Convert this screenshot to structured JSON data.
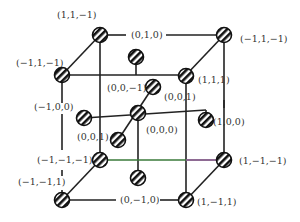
{
  "diagram": {
    "colors": {
      "line": "#222222",
      "accent_line": "#3a7a3a",
      "accent_line2": "#9a5aa0",
      "text": "#333333"
    },
    "nodes": [
      {
        "id": "n1",
        "x": 100,
        "y": 35,
        "label": "(1,1,−1)",
        "lx": 57,
        "ly": 18,
        "anchor": "start"
      },
      {
        "id": "n2",
        "x": 224,
        "y": 35,
        "label": "(−1,1,−1)",
        "lx": 240,
        "ly": 42,
        "anchor": "start"
      },
      {
        "id": "n3",
        "x": 62,
        "y": 75,
        "label": "(−1,1,−1)",
        "lx": 16,
        "ly": 66,
        "anchor": "start"
      },
      {
        "id": "n4",
        "x": 186,
        "y": 76,
        "label": "(1,1,1)",
        "lx": 198,
        "ly": 83,
        "anchor": "start"
      },
      {
        "id": "n5",
        "x": 136,
        "y": 57,
        "label": "",
        "lx": 0,
        "ly": 0,
        "anchor": "start"
      },
      {
        "id": "n6",
        "x": 153,
        "y": 87,
        "label": "(0,0,−1)",
        "lx": 107,
        "ly": 91,
        "anchor": "start"
      },
      {
        "id": "n7",
        "x": 138,
        "y": 113,
        "label": "(0,0,0)",
        "lx": 146,
        "ly": 133,
        "anchor": "start"
      },
      {
        "id": "n8",
        "x": 84,
        "y": 118,
        "label": "(−1,0,0)",
        "lx": 34,
        "ly": 110,
        "anchor": "start"
      },
      {
        "id": "n9",
        "x": 206,
        "y": 120,
        "label": "(1,0,0)",
        "lx": 213,
        "ly": 125,
        "anchor": "start"
      },
      {
        "id": "n10",
        "x": 118,
        "y": 140,
        "label": "(0,0,1)",
        "lx": 77,
        "ly": 140,
        "anchor": "start"
      },
      {
        "id": "n11",
        "x": 100,
        "y": 160,
        "label": "(−1,−1,−1)",
        "lx": 37,
        "ly": 163,
        "anchor": "start"
      },
      {
        "id": "n12",
        "x": 224,
        "y": 160,
        "label": "(1,−1,−1)",
        "lx": 239,
        "ly": 164,
        "anchor": "start"
      },
      {
        "id": "n13",
        "x": 138,
        "y": 178,
        "label": "",
        "lx": 0,
        "ly": 0,
        "anchor": "start"
      },
      {
        "id": "n14",
        "x": 62,
        "y": 200,
        "label": "(−1,−1,1)",
        "lx": 18,
        "ly": 185,
        "anchor": "start"
      },
      {
        "id": "n15",
        "x": 186,
        "y": 200,
        "label": "(1,−1,1)",
        "lx": 197,
        "ly": 205,
        "anchor": "start"
      }
    ],
    "extra_labels": [
      {
        "text": "(0,1,0)",
        "x": 131,
        "y": 38
      },
      {
        "text": "(0,0,1)",
        "x": 164,
        "y": 100
      },
      {
        "text": "(0,−1,0)",
        "x": 120,
        "y": 203
      }
    ]
  }
}
